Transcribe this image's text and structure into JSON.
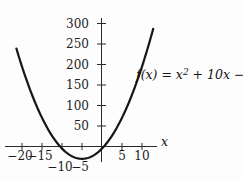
{
  "figure": {
    "formula": {
      "pre": "f(x) = x",
      "sup": "2",
      "post": " + 10x − 5"
    },
    "x_axis_label": "x"
  },
  "chart_data": {
    "type": "line",
    "title": "",
    "xlabel": "x",
    "ylabel": "",
    "function": "f(x) = x^2 + 10x - 5",
    "coefficients": {
      "a": 1,
      "b": 10,
      "c": -5
    },
    "x_ticks": [
      -20,
      -15,
      -10,
      -5,
      5,
      10
    ],
    "y_ticks": [
      50,
      100,
      150,
      200,
      250,
      300
    ],
    "x_range": [
      -24,
      14
    ],
    "y_range": [
      -40,
      310
    ],
    "x_domain_drawn": [
      -21.4,
      12.8
    ],
    "grid": false,
    "legend": "none",
    "key_points": {
      "vertex": [
        -5,
        -30
      ],
      "y_intercept": [
        0,
        -5
      ],
      "x_intercepts": [
        -10.48,
        0.48
      ]
    },
    "sample_points": [
      [
        -21.4,
        238.96
      ],
      [
        -20,
        195
      ],
      [
        -15,
        70
      ],
      [
        -10,
        -5
      ],
      [
        -5,
        -30
      ],
      [
        0,
        -5
      ],
      [
        5,
        70
      ],
      [
        10,
        195
      ],
      [
        12.8,
        286.84
      ]
    ],
    "curve_color": "#161616",
    "axis_color": "#2a2a2a"
  }
}
